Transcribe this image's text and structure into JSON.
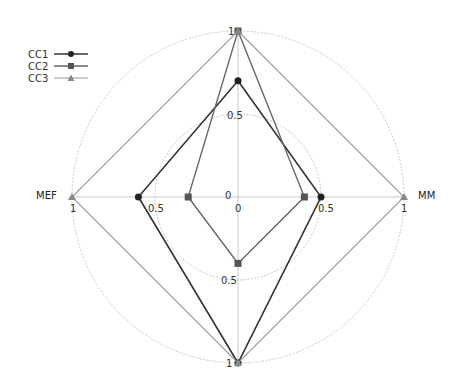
{
  "chart_data": {
    "type": "radar",
    "title": "",
    "axes": [
      "",
      "MM",
      "",
      "MEF"
    ],
    "axis_angles_deg": [
      90,
      0,
      -90,
      180
    ],
    "range": [
      0,
      1
    ],
    "rings": [
      0.5,
      1
    ],
    "tick_labels": [
      "0",
      "0.5",
      "1"
    ],
    "series": [
      {
        "name": "CC1",
        "marker": "circle",
        "color": "#333333",
        "values": [
          0.7,
          0.5,
          1,
          0.6
        ]
      },
      {
        "name": "CC2",
        "marker": "square",
        "color": "#666666",
        "values": [
          1,
          0.4,
          0.4,
          0.3
        ]
      },
      {
        "name": "CC3",
        "marker": "triangle",
        "color": "#999999",
        "values": [
          1,
          1,
          1,
          1
        ]
      }
    ],
    "legend_position": "top-left",
    "grid": true
  },
  "legend": {
    "items": [
      {
        "label": "CC1"
      },
      {
        "label": "CC2"
      },
      {
        "label": "CC3"
      }
    ]
  },
  "axis_labels": {
    "right": "MM",
    "left": "MEF"
  }
}
